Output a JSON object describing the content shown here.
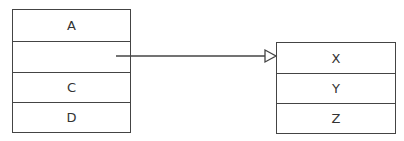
{
  "diagram": {
    "left_box": {
      "cells": [
        "A",
        "",
        "C",
        "D"
      ]
    },
    "right_box": {
      "cells": [
        "X",
        "Y",
        "Z"
      ]
    },
    "arrow": {
      "from": "left_box.cells.1",
      "to": "right_box",
      "head": "hollow-triangle",
      "color": "#444444"
    }
  }
}
